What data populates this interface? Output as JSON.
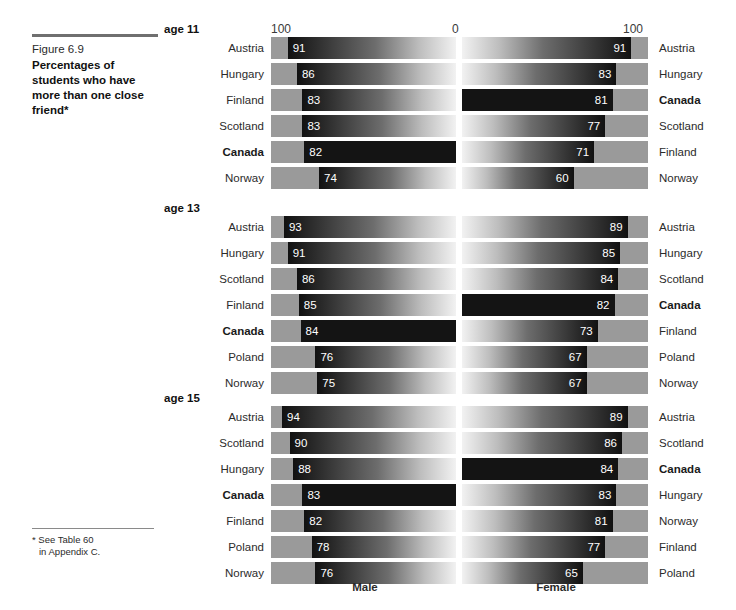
{
  "caption": {
    "figure_number": "Figure 6.9",
    "title": "Percentages of students who have more than one close friend*"
  },
  "footnote": {
    "line1": "* See Table 60",
    "line2": "in Appendix C."
  },
  "axis": {
    "left": "100",
    "middle": "0",
    "right": "100"
  },
  "bottom_labels": {
    "male": "Male",
    "female": "Female"
  },
  "highlight_country": "Canada",
  "chart_data": {
    "type": "bar",
    "title": "Percentages of students who have more than one close friend",
    "subtitle": "Figure 6.9",
    "xlabel": "",
    "ylabel": "",
    "xlim": [
      0,
      100
    ],
    "grid": false,
    "legend_position": "bottom",
    "orientation": "horizontal",
    "layout": "diverging-paired (male axis reversed, female axis normal)",
    "series": [
      {
        "name": "Male"
      },
      {
        "name": "Female"
      }
    ],
    "groups": [
      {
        "label": "age 11",
        "male": [
          {
            "country": "Austria",
            "value": 91
          },
          {
            "country": "Hungary",
            "value": 86
          },
          {
            "country": "Finland",
            "value": 83
          },
          {
            "country": "Scotland",
            "value": 83
          },
          {
            "country": "Canada",
            "value": 82
          },
          {
            "country": "Norway",
            "value": 74
          }
        ],
        "female": [
          {
            "country": "Austria",
            "value": 91
          },
          {
            "country": "Hungary",
            "value": 83
          },
          {
            "country": "Canada",
            "value": 81
          },
          {
            "country": "Scotland",
            "value": 77
          },
          {
            "country": "Finland",
            "value": 71
          },
          {
            "country": "Norway",
            "value": 60
          }
        ]
      },
      {
        "label": "age 13",
        "male": [
          {
            "country": "Austria",
            "value": 93
          },
          {
            "country": "Hungary",
            "value": 91
          },
          {
            "country": "Scotland",
            "value": 86
          },
          {
            "country": "Finland",
            "value": 85
          },
          {
            "country": "Canada",
            "value": 84
          },
          {
            "country": "Poland",
            "value": 76
          },
          {
            "country": "Norway",
            "value": 75
          }
        ],
        "female": [
          {
            "country": "Austria",
            "value": 89
          },
          {
            "country": "Hungary",
            "value": 85
          },
          {
            "country": "Scotland",
            "value": 84
          },
          {
            "country": "Canada",
            "value": 82
          },
          {
            "country": "Finland",
            "value": 73
          },
          {
            "country": "Poland",
            "value": 67
          },
          {
            "country": "Norway",
            "value": 67
          }
        ]
      },
      {
        "label": "age 15",
        "male": [
          {
            "country": "Austria",
            "value": 94
          },
          {
            "country": "Scotland",
            "value": 90
          },
          {
            "country": "Hungary",
            "value": 88
          },
          {
            "country": "Canada",
            "value": 83
          },
          {
            "country": "Finland",
            "value": 82
          },
          {
            "country": "Poland",
            "value": 78
          },
          {
            "country": "Norway",
            "value": 76
          }
        ],
        "female": [
          {
            "country": "Austria",
            "value": 89
          },
          {
            "country": "Scotland",
            "value": 86
          },
          {
            "country": "Canada",
            "value": 84
          },
          {
            "country": "Hungary",
            "value": 83
          },
          {
            "country": "Norway",
            "value": 81
          },
          {
            "country": "Finland",
            "value": 77
          },
          {
            "country": "Poland",
            "value": 65
          }
        ]
      }
    ]
  }
}
